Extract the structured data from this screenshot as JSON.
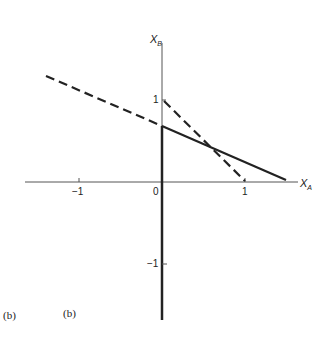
{
  "figure": {
    "axes": {
      "x_label": "X",
      "x_label_sub": "A",
      "y_label": "X",
      "y_label_sub": "B",
      "x_ticks": [
        {
          "value": -1,
          "label": "−1"
        },
        {
          "value": 0,
          "label": "0"
        },
        {
          "value": 1,
          "label": "1"
        }
      ],
      "y_ticks": [
        {
          "value": 1,
          "label": "1"
        },
        {
          "value": -1,
          "label": "−1"
        }
      ]
    },
    "lines": [
      {
        "name": "solid-line",
        "style": "solid",
        "from": [
          -1.4,
          0.65
        ],
        "to": [
          1.5,
          0.02
        ]
      },
      {
        "name": "dashed-dot-line",
        "style": "dashed",
        "from": [
          0,
          1
        ],
        "to": [
          1,
          0
        ]
      }
    ],
    "captions": [
      "(b)",
      "(b)"
    ]
  }
}
